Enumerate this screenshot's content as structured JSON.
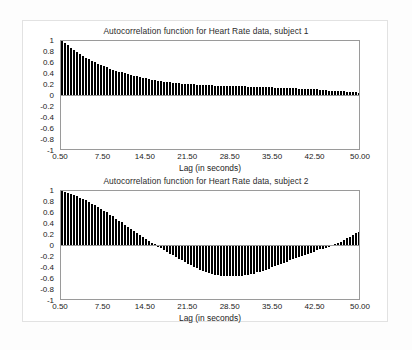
{
  "page": {
    "background": "#ffffff",
    "border_color": "#e2e2e2"
  },
  "axis": {
    "y_ticks": [
      "1",
      "0.8",
      "0.6",
      "0.4",
      "0.2",
      "0",
      "-0.2",
      "-0.4",
      "-0.6",
      "-0.8",
      "-1"
    ],
    "y_tick_values": [
      1,
      0.8,
      0.6,
      0.4,
      0.2,
      0,
      -0.2,
      -0.4,
      -0.6,
      -0.8,
      -1
    ],
    "x_ticks": [
      "0.50",
      "7.50",
      "14.50",
      "21.50",
      "28.50",
      "35.50",
      "42.50",
      "50.00"
    ],
    "x_tick_values": [
      0.5,
      7.5,
      14.5,
      21.5,
      28.5,
      35.5,
      42.5,
      50.0
    ],
    "x_title": "Lag (in seconds)",
    "bar_color": "#000000",
    "frame_color": "#9a9a9a"
  },
  "chart_data": [
    {
      "type": "bar",
      "title": "Autocorrelation function for Heart Rate data, subject 1",
      "xlabel": "Lag (in seconds)",
      "ylabel": "",
      "xlim": [
        0.5,
        50.0
      ],
      "ylim": [
        -1,
        1
      ],
      "grid": false,
      "legend": "none",
      "x": [
        0.5,
        1.0,
        1.5,
        2.0,
        2.5,
        3.0,
        3.5,
        4.0,
        4.5,
        5.0,
        5.5,
        6.0,
        6.5,
        7.0,
        7.5,
        8.0,
        8.5,
        9.0,
        9.5,
        10.0,
        10.5,
        11.0,
        11.5,
        12.0,
        12.5,
        13.0,
        13.5,
        14.0,
        14.5,
        15.0,
        15.5,
        16.0,
        16.5,
        17.0,
        17.5,
        18.0,
        18.5,
        19.0,
        19.5,
        20.0,
        20.5,
        21.0,
        21.5,
        22.0,
        22.5,
        23.0,
        23.5,
        24.0,
        24.5,
        25.0,
        25.5,
        26.0,
        26.5,
        27.0,
        27.5,
        28.0,
        28.5,
        29.0,
        29.5,
        30.0,
        30.5,
        31.0,
        31.5,
        32.0,
        32.5,
        33.0,
        33.5,
        34.0,
        34.5,
        35.0,
        35.5,
        36.0,
        36.5,
        37.0,
        37.5,
        38.0,
        38.5,
        39.0,
        39.5,
        40.0,
        40.5,
        41.0,
        41.5,
        42.0,
        42.5,
        43.0,
        43.5,
        44.0,
        44.5,
        45.0,
        45.5,
        46.0,
        46.5,
        47.0,
        47.5,
        48.0,
        48.5,
        49.0,
        49.5,
        50.0
      ],
      "values": [
        1.0,
        0.96,
        0.92,
        0.88,
        0.84,
        0.8,
        0.76,
        0.73,
        0.7,
        0.67,
        0.64,
        0.61,
        0.58,
        0.56,
        0.54,
        0.52,
        0.5,
        0.48,
        0.46,
        0.44,
        0.43,
        0.41,
        0.4,
        0.38,
        0.37,
        0.36,
        0.34,
        0.33,
        0.32,
        0.31,
        0.3,
        0.29,
        0.28,
        0.27,
        0.26,
        0.25,
        0.25,
        0.24,
        0.23,
        0.23,
        0.22,
        0.22,
        0.21,
        0.21,
        0.21,
        0.2,
        0.2,
        0.2,
        0.2,
        0.2,
        0.2,
        0.19,
        0.19,
        0.19,
        0.19,
        0.19,
        0.19,
        0.18,
        0.18,
        0.18,
        0.18,
        0.18,
        0.17,
        0.17,
        0.17,
        0.17,
        0.16,
        0.16,
        0.16,
        0.16,
        0.16,
        0.15,
        0.15,
        0.15,
        0.15,
        0.14,
        0.14,
        0.14,
        0.14,
        0.13,
        0.13,
        0.13,
        0.12,
        0.12,
        0.12,
        0.12,
        0.11,
        0.11,
        0.11,
        0.1,
        0.1,
        0.1,
        0.09,
        0.09,
        0.09,
        0.08,
        0.08,
        0.07,
        0.07,
        0.06
      ]
    },
    {
      "type": "bar",
      "title": "Autocorrelation function for Heart Rate data, subject 2",
      "xlabel": "Lag (in seconds)",
      "ylabel": "",
      "xlim": [
        0.5,
        50.0
      ],
      "ylim": [
        -1,
        1
      ],
      "grid": false,
      "legend": "none",
      "x": [
        0.5,
        1.0,
        1.5,
        2.0,
        2.5,
        3.0,
        3.5,
        4.0,
        4.5,
        5.0,
        5.5,
        6.0,
        6.5,
        7.0,
        7.5,
        8.0,
        8.5,
        9.0,
        9.5,
        10.0,
        10.5,
        11.0,
        11.5,
        12.0,
        12.5,
        13.0,
        13.5,
        14.0,
        14.5,
        15.0,
        15.5,
        16.0,
        16.5,
        17.0,
        17.5,
        18.0,
        18.5,
        19.0,
        19.5,
        20.0,
        20.5,
        21.0,
        21.5,
        22.0,
        22.5,
        23.0,
        23.5,
        24.0,
        24.5,
        25.0,
        25.5,
        26.0,
        26.5,
        27.0,
        27.5,
        28.0,
        28.5,
        29.0,
        29.5,
        30.0,
        30.5,
        31.0,
        31.5,
        32.0,
        32.5,
        33.0,
        33.5,
        34.0,
        34.5,
        35.0,
        35.5,
        36.0,
        36.5,
        37.0,
        37.5,
        38.0,
        38.5,
        39.0,
        39.5,
        40.0,
        40.5,
        41.0,
        41.5,
        42.0,
        42.5,
        43.0,
        43.5,
        44.0,
        44.5,
        45.0,
        45.5,
        46.0,
        46.5,
        47.0,
        47.5,
        48.0,
        48.5,
        49.0,
        49.5,
        50.0
      ],
      "values": [
        1.0,
        0.99,
        0.97,
        0.95,
        0.93,
        0.91,
        0.88,
        0.86,
        0.83,
        0.8,
        0.77,
        0.74,
        0.71,
        0.68,
        0.64,
        0.61,
        0.57,
        0.54,
        0.5,
        0.46,
        0.43,
        0.39,
        0.35,
        0.31,
        0.28,
        0.24,
        0.2,
        0.17,
        0.13,
        0.1,
        0.06,
        0.03,
        0.0,
        -0.04,
        -0.07,
        -0.1,
        -0.14,
        -0.17,
        -0.2,
        -0.23,
        -0.26,
        -0.29,
        -0.32,
        -0.35,
        -0.38,
        -0.4,
        -0.43,
        -0.45,
        -0.47,
        -0.49,
        -0.51,
        -0.52,
        -0.53,
        -0.54,
        -0.55,
        -0.55,
        -0.55,
        -0.55,
        -0.55,
        -0.54,
        -0.54,
        -0.53,
        -0.52,
        -0.51,
        -0.5,
        -0.48,
        -0.47,
        -0.45,
        -0.43,
        -0.41,
        -0.39,
        -0.37,
        -0.35,
        -0.33,
        -0.31,
        -0.29,
        -0.26,
        -0.24,
        -0.22,
        -0.2,
        -0.18,
        -0.16,
        -0.14,
        -0.12,
        -0.1,
        -0.08,
        -0.06,
        -0.05,
        -0.03,
        -0.01,
        0.01,
        0.03,
        0.05,
        0.08,
        0.11,
        0.14,
        0.17,
        0.2,
        0.23,
        0.25
      ]
    }
  ]
}
